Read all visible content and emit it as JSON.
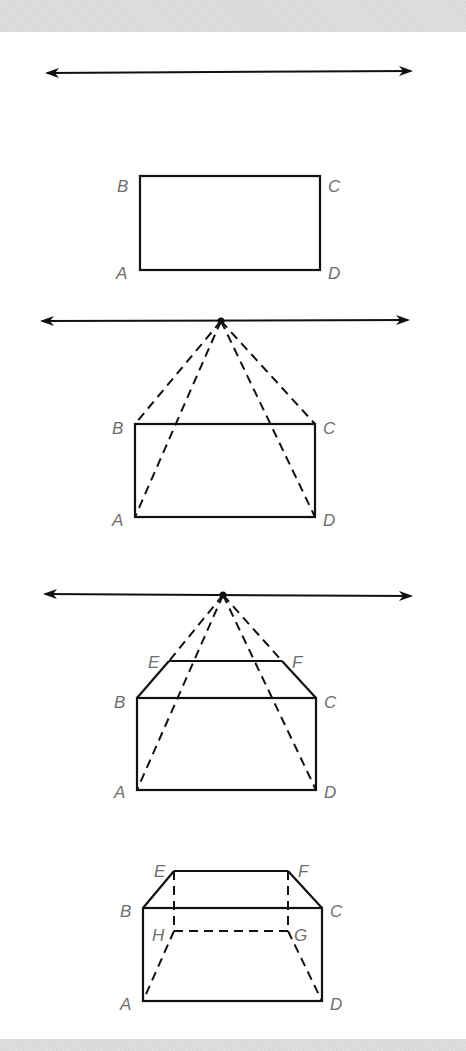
{
  "figure": {
    "band_color": "#d9d9d9",
    "line_color": "#111111",
    "label_color": "#6e6e6e"
  },
  "steps": [
    {
      "id": 1,
      "horizon_line": {
        "y": 72,
        "x1": 45,
        "x2": 413
      },
      "rectangle": {
        "A": [
          140,
          270
        ],
        "B": [
          140,
          176
        ],
        "C": [
          320,
          176
        ],
        "D": [
          320,
          270
        ]
      },
      "labels": {
        "A": "A",
        "B": "B",
        "C": "C",
        "D": "D"
      }
    },
    {
      "id": 2,
      "horizon_line": {
        "y": 321,
        "x1": 40,
        "x2": 410
      },
      "vanishing_point": [
        221,
        321
      ],
      "rectangle": {
        "A": [
          135,
          517
        ],
        "B": [
          135,
          424
        ],
        "C": [
          315,
          424
        ],
        "D": [
          315,
          517
        ]
      },
      "labels": {
        "A": "A",
        "B": "B",
        "C": "C",
        "D": "D"
      }
    },
    {
      "id": 3,
      "horizon_line": {
        "y": 595,
        "x1": 43,
        "x2": 413
      },
      "vanishing_point": [
        223,
        595
      ],
      "rectangle": {
        "A": [
          137,
          790
        ],
        "B": [
          137,
          698
        ],
        "C": [
          316,
          698
        ],
        "D": [
          316,
          790
        ]
      },
      "top_edge": {
        "E": [
          169,
          661
        ],
        "F": [
          282,
          661
        ]
      },
      "labels": {
        "A": "A",
        "B": "B",
        "C": "C",
        "D": "D",
        "E": "E",
        "F": "F"
      }
    },
    {
      "id": 4,
      "box": {
        "A": [
          143,
          1001
        ],
        "B": [
          143,
          908
        ],
        "C": [
          322,
          908
        ],
        "D": [
          322,
          1001
        ],
        "E": [
          174,
          871
        ],
        "F": [
          288,
          871
        ],
        "G": [
          288,
          931
        ],
        "H": [
          174,
          931
        ]
      },
      "labels": {
        "A": "A",
        "B": "B",
        "C": "C",
        "D": "D",
        "E": "E",
        "F": "F",
        "G": "G",
        "H": "H"
      }
    }
  ]
}
